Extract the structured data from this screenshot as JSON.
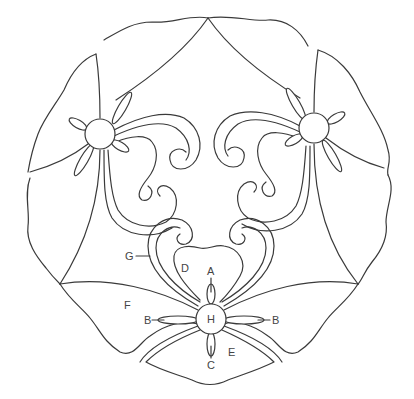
{
  "diagram": {
    "type": "quilting-pattern",
    "colors": {
      "stroke": "#3a3a3a",
      "background": "#ffffff",
      "label": "#444444"
    },
    "labels": {
      "A": "A",
      "B_left": "B",
      "B_right": "B",
      "C": "C",
      "D": "D",
      "E": "E",
      "F": "F",
      "G": "G",
      "H": "H"
    }
  }
}
